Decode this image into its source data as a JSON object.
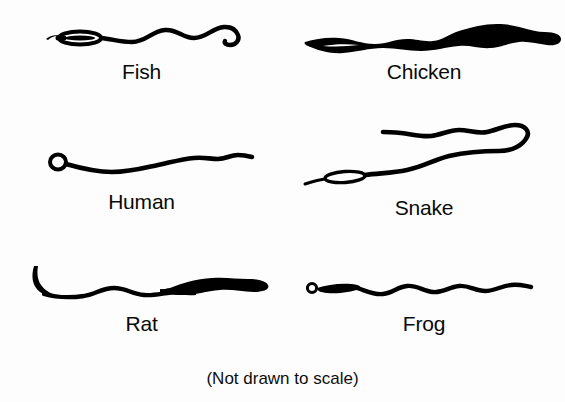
{
  "figure": {
    "caption": "(Not drawn to scale)",
    "ink_color": "#000000",
    "background_color": "#ffffff",
    "columns": 2,
    "rows": 3
  },
  "specimens": [
    {
      "label": "Fish",
      "icon": "sperm-cell-fish",
      "row": 1,
      "column": 1,
      "head_shape": "elongated hollow oval",
      "tail_shape": "long wavy tail with hooked tip"
    },
    {
      "label": "Chicken",
      "icon": "sperm-cell-chicken",
      "row": 1,
      "column": 2,
      "head_shape": "narrow tapered sliver",
      "tail_shape": "long ribbon widening toward rounded tip"
    },
    {
      "label": "Human",
      "icon": "sperm-cell-human",
      "row": 2,
      "column": 1,
      "head_shape": "small round ring head",
      "tail_shape": "long gently undulating tapering tail"
    },
    {
      "label": "Snake",
      "icon": "sperm-cell-snake",
      "row": 2,
      "column": 2,
      "head_shape": "thin elongated oval",
      "tail_shape": "very long tail looping back on itself"
    },
    {
      "label": "Rat",
      "icon": "sperm-cell-rat",
      "row": 3,
      "column": 1,
      "head_shape": "hooked sickle-shaped head",
      "tail_shape": "wavy tail thickening into broad band"
    },
    {
      "label": "Frog",
      "icon": "sperm-cell-frog",
      "row": 3,
      "column": 2,
      "head_shape": "tiny ring head with narrow sliver midpiece",
      "tail_shape": "long regularly undulating tail"
    }
  ]
}
